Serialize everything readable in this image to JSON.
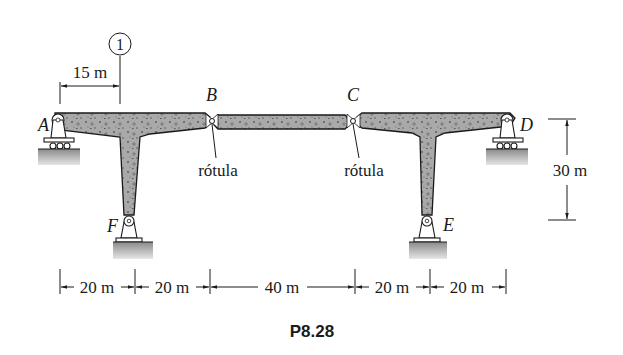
{
  "figure": {
    "caption": "P8.28",
    "section_marker": "1",
    "dimensions": {
      "section_offset": "15 m",
      "height": "30 m",
      "spans": [
        "20 m",
        "20 m",
        "40 m",
        "20 m",
        "20 m"
      ]
    },
    "points": {
      "A": "A",
      "B": "B",
      "C": "C",
      "D": "D",
      "E": "E",
      "F": "F"
    },
    "hinge_labels": {
      "B": "rótula",
      "C": "rótula"
    },
    "colors": {
      "concrete": "#a9a9a9",
      "ground_top": "#8a8a8a",
      "ground_bottom": "#e6e6e6",
      "ink": "#1a1a1a"
    }
  }
}
